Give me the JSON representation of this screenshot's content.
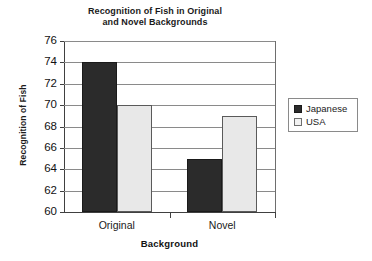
{
  "chart_data": {
    "type": "bar",
    "title": "Recognition of Fish in Original and Novel Backgrounds",
    "title_lines": [
      "Recognition of Fish in Original",
      "and Novel Backgrounds"
    ],
    "xlabel": "Background",
    "ylabel": "Recognition of Fish",
    "categories": [
      "Original",
      "Novel"
    ],
    "series": [
      {
        "name": "Japanese",
        "values": [
          74,
          65
        ],
        "color": "#2b2b2b"
      },
      {
        "name": "USA",
        "values": [
          70,
          69
        ],
        "color": "#e8e8e8"
      }
    ],
    "ylim": [
      60,
      76
    ],
    "yticks": [
      60,
      62,
      64,
      66,
      68,
      70,
      72,
      74,
      76
    ],
    "ytick_labels": [
      "60",
      "62",
      "64",
      "66",
      "68",
      "70",
      "72",
      "74",
      "76"
    ],
    "grid": true,
    "grid_axis": "y",
    "legend_position": "right"
  },
  "legend": {
    "entries": [
      {
        "label": "Japanese",
        "swatch": "dark"
      },
      {
        "label": "USA",
        "swatch": "light"
      }
    ]
  }
}
